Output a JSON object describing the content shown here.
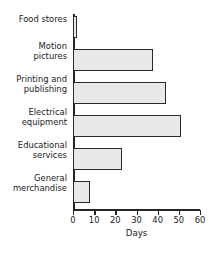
{
  "chart_data": {
    "type": "bar",
    "orientation": "horizontal",
    "title": "",
    "xlabel": "Days",
    "ylabel": "",
    "xlim": [
      0,
      60
    ],
    "xticks": [
      0,
      10,
      20,
      30,
      40,
      50,
      60
    ],
    "grid": false,
    "legend": null,
    "categories": [
      "Food stores",
      "Motion pictures",
      "Printing and publishing",
      "Electrical equipment",
      "Educational services",
      "General merchandise"
    ],
    "category_lines": [
      [
        "Food stores",
        ""
      ],
      [
        "Motion",
        "pictures"
      ],
      [
        "Printing and",
        "publishing"
      ],
      [
        "Electrical",
        "equipment"
      ],
      [
        "Educational",
        "services"
      ],
      [
        "General",
        "merchandise"
      ]
    ],
    "values": [
      2,
      38,
      44,
      51,
      23,
      8
    ],
    "bar_fill": "#e8e8e8",
    "bar_edge": "#2b2b2b",
    "axis_color": "#262626"
  }
}
